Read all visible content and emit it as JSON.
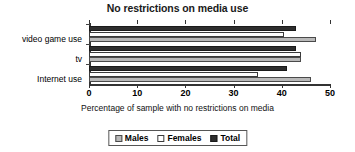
{
  "chart_data": {
    "type": "bar",
    "orientation": "horizontal",
    "title": "No restrictions on media use",
    "xlabel": "Percentage of sample with no restrictions on media",
    "ylabel": "",
    "xlim": [
      0,
      50
    ],
    "xticks": [
      "0",
      "10",
      "20",
      "30",
      "40",
      "50"
    ],
    "grid": false,
    "legend_position": "bottom-center",
    "categories": [
      "video game use",
      "tv",
      "Internet use"
    ],
    "series": [
      {
        "name": "Males",
        "color": "#b9b9b9",
        "values": [
          47,
          44,
          46
        ]
      },
      {
        "name": "Females",
        "color": "#ffffff",
        "values": [
          40.5,
          44,
          35
        ]
      },
      {
        "name": "Total",
        "color": "#2e2e2e",
        "values": [
          43,
          43,
          41
        ]
      }
    ]
  },
  "legend": {
    "items": [
      {
        "label": "Males"
      },
      {
        "label": "Females"
      },
      {
        "label": "Total"
      }
    ]
  }
}
